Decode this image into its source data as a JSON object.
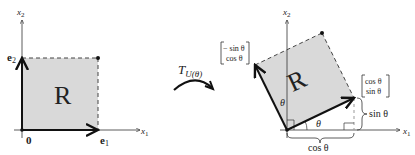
{
  "left_figure": {
    "region_label": "R",
    "axis_x_label": "x",
    "axis_x_sub": "1",
    "axis_y_label": "x",
    "axis_y_sub": "2",
    "origin_label": "0",
    "e1_label": "e",
    "e1_sub": "1",
    "e2_label": "e",
    "e2_sub": "2"
  },
  "transform": {
    "label": "T",
    "subscript": "U(θ)"
  },
  "right_figure": {
    "region_label": "R",
    "axis_x_label": "x",
    "axis_x_sub": "1",
    "axis_y_label": "x",
    "axis_y_sub": "2",
    "image_e2_top": "− sin θ",
    "image_e2_bottom": "cos θ",
    "image_e1_top": "cos θ",
    "image_e1_bottom": "sin θ",
    "angle_label_vertical": "θ",
    "angle_label_horizontal": "θ",
    "brace_vertical_label": "sin θ",
    "brace_horizontal_label": "cos θ"
  },
  "colors": {
    "region_fill": "#d9d9d9",
    "axis": "#333333",
    "vector": "#1a1a1a",
    "dashed": "#444444"
  }
}
